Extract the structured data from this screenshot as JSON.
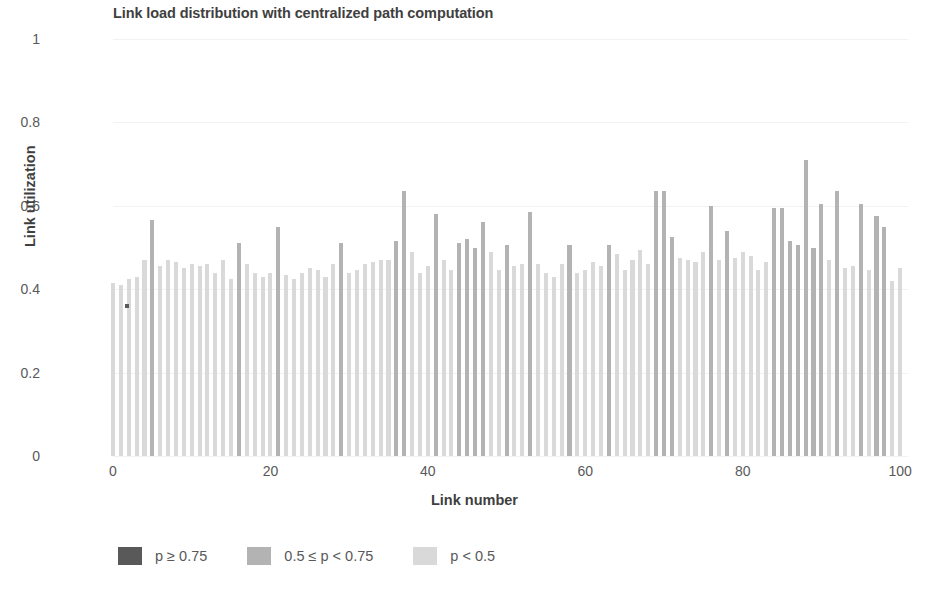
{
  "chart_data": {
    "type": "bar",
    "title": "Link load distribution with centralized path computation",
    "xlabel": "Link number",
    "ylabel": "Link utilization",
    "xlim": [
      0,
      101
    ],
    "ylim": [
      0,
      1
    ],
    "grid": true,
    "legend_position": "bottom-left",
    "y_ticks": [
      "0",
      "0.2",
      "0.4",
      "0.6",
      "0.8",
      "1"
    ],
    "y_tick_values": [
      0,
      0.2,
      0.4,
      0.6,
      0.8,
      1
    ],
    "x_ticks": [
      "0",
      "20",
      "40",
      "60",
      "80",
      "100"
    ],
    "x_tick_values": [
      0,
      20,
      40,
      60,
      80,
      100
    ],
    "legend": [
      {
        "label": "p ≥ 0.75",
        "color": "#595959",
        "threshold_min": 0.75
      },
      {
        "label": "0.5 ≤ p < 0.75",
        "color": "#b3b3b3",
        "threshold_min": 0.5
      },
      {
        "label": "p < 0.5",
        "color": "#d9d9d9",
        "threshold_min": 0
      }
    ],
    "categories": [
      0,
      1,
      2,
      3,
      4,
      5,
      6,
      7,
      8,
      9,
      10,
      11,
      12,
      13,
      14,
      15,
      16,
      17,
      18,
      19,
      20,
      21,
      22,
      23,
      24,
      25,
      26,
      27,
      28,
      29,
      30,
      31,
      32,
      33,
      34,
      35,
      36,
      37,
      38,
      39,
      40,
      41,
      42,
      43,
      44,
      45,
      46,
      47,
      48,
      49,
      50,
      51,
      52,
      53,
      54,
      55,
      56,
      57,
      58,
      59,
      60,
      61,
      62,
      63,
      64,
      65,
      66,
      67,
      68,
      69,
      70,
      71,
      72,
      73,
      74,
      75,
      76,
      77,
      78,
      79,
      80,
      81,
      82,
      83,
      84,
      85,
      86,
      87,
      88,
      89,
      90,
      91,
      92,
      93,
      94,
      95,
      96,
      97,
      98,
      99,
      100
    ],
    "values": [
      0.415,
      0.41,
      0.425,
      0.43,
      0.47,
      0.565,
      0.455,
      0.47,
      0.465,
      0.45,
      0.46,
      0.455,
      0.46,
      0.44,
      0.47,
      0.425,
      0.51,
      0.46,
      0.44,
      0.43,
      0.44,
      0.55,
      0.435,
      0.425,
      0.44,
      0.45,
      0.445,
      0.43,
      0.46,
      0.51,
      0.44,
      0.445,
      0.46,
      0.465,
      0.47,
      0.47,
      0.515,
      0.635,
      0.49,
      0.44,
      0.455,
      0.58,
      0.47,
      0.445,
      0.51,
      0.52,
      0.5,
      0.56,
      0.49,
      0.445,
      0.505,
      0.455,
      0.46,
      0.585,
      0.46,
      0.44,
      0.43,
      0.46,
      0.505,
      0.44,
      0.445,
      0.465,
      0.455,
      0.505,
      0.485,
      0.445,
      0.47,
      0.495,
      0.46,
      0.635,
      0.635,
      0.525,
      0.475,
      0.47,
      0.465,
      0.49,
      0.6,
      0.47,
      0.54,
      0.475,
      0.49,
      0.48,
      0.445,
      0.465,
      0.595,
      0.595,
      0.515,
      0.505,
      0.71,
      0.5,
      0.605,
      0.47,
      0.635,
      0.45,
      0.455,
      0.605,
      0.445,
      0.575,
      0.55,
      0.42,
      0.45
    ],
    "stray_marker": {
      "x": 1,
      "y": 0.365,
      "color": "#595959"
    }
  }
}
